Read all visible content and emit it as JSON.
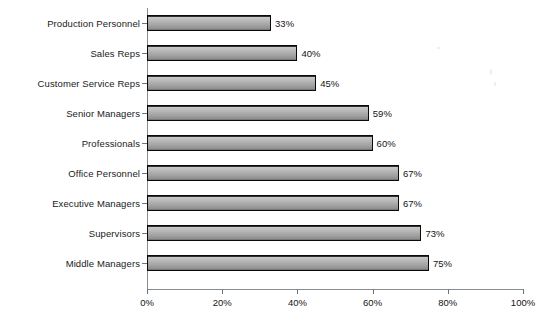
{
  "chart_data": {
    "type": "bar",
    "orientation": "horizontal",
    "title": "",
    "xlabel": "",
    "ylabel": "",
    "categories": [
      "Production Personnel",
      "Sales Reps",
      "Customer Service Reps",
      "Senior Managers",
      "Professionals",
      "Office Personnel",
      "Executive Managers",
      "Supervisors",
      "Middle Managers"
    ],
    "values": [
      33,
      40,
      45,
      59,
      60,
      67,
      67,
      73,
      75
    ],
    "value_labels": [
      "33%",
      "40%",
      "45%",
      "59%",
      "60%",
      "67%",
      "67%",
      "73%",
      "75%"
    ],
    "xlim": [
      0,
      100
    ],
    "xticks": [
      0,
      20,
      40,
      60,
      80,
      100
    ],
    "xtick_labels": [
      "0%",
      "20%",
      "40%",
      "60%",
      "80%",
      "100%"
    ],
    "grid": false,
    "legend": false,
    "bar_color": "#a8a8a8",
    "bar_border_color": "#0a0a0a",
    "background_color": "#ffffff"
  }
}
